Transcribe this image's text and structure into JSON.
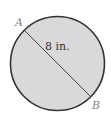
{
  "diagram": {
    "shape": "circle",
    "fill_color": "#d9d9d9",
    "stroke_color": "#333333",
    "points": {
      "A": {
        "label": "A"
      },
      "B": {
        "label": "B"
      }
    },
    "segment": {
      "from": "A",
      "to": "B",
      "type": "diameter",
      "length_label": "8 in."
    }
  }
}
